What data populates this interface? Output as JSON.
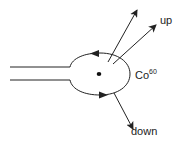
{
  "diagram": {
    "labels": {
      "up": "up",
      "down": "down",
      "isotope_base": "Co",
      "isotope_mass": "60"
    },
    "elements": {
      "nucleus": "Co-60 nucleus (dot)",
      "current_loop": "circulating current loop with two direction arrows",
      "leads": "two parallel lead wires entering from left",
      "emission_arrows": [
        "up (two arrows)",
        "down (one arrow)"
      ]
    },
    "colors": {
      "stroke": "#222222",
      "background": "#ffffff"
    }
  }
}
